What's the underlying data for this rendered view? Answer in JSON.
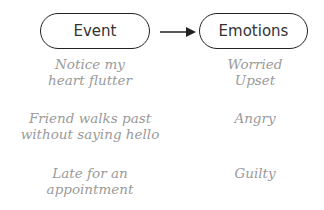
{
  "header": {
    "left_label": "Event",
    "right_label": "Emotions",
    "connector": "arrow-right"
  },
  "rows": [
    {
      "event": [
        "Notice my",
        "heart flutter"
      ],
      "emotions": [
        "Worried",
        "Upset"
      ]
    },
    {
      "event": [
        "Friend walks past",
        "without saying hello"
      ],
      "emotions": [
        "Angry"
      ]
    },
    {
      "event": [
        "Late for an",
        "appointment"
      ],
      "emotions": [
        "Guilty"
      ]
    }
  ],
  "colors": {
    "outline": "#222222",
    "label_text": "#333333",
    "handwriting_text": "#9a9a9a"
  }
}
